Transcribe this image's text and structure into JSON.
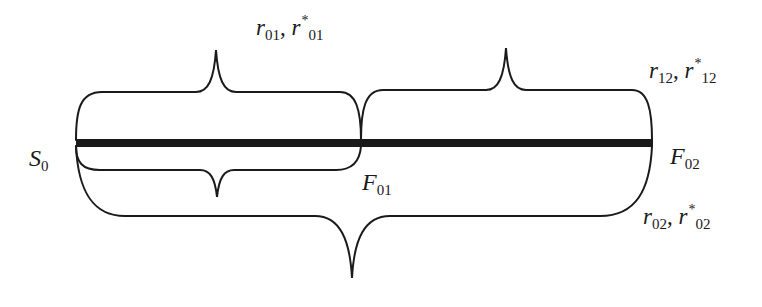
{
  "diagram": {
    "colors": {
      "stroke": "#1a1a1a",
      "background": "#ffffff"
    },
    "points": {
      "start": {
        "base": "S",
        "sub": "0"
      },
      "mid": {
        "base": "F",
        "sub": "01"
      },
      "end": {
        "base": "F",
        "sub": "02"
      }
    },
    "braces": {
      "upper_left": {
        "r": "r",
        "r_sub": "01",
        "sep": ",",
        "rstar": "r",
        "star": "*",
        "rstar_sub": "01"
      },
      "upper_right": {
        "r": "r",
        "r_sub": "12",
        "sep": ",",
        "rstar": "r",
        "star": "*",
        "rstar_sub": "12"
      },
      "lower_outer": {
        "r": "r",
        "r_sub": "02",
        "sep": ",",
        "rstar": "r",
        "star": "*",
        "rstar_sub": "02"
      }
    }
  }
}
